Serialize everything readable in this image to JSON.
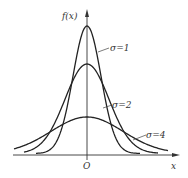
{
  "chart_data": {
    "type": "line",
    "title": "",
    "xlabel": "x",
    "ylabel": "f(x)",
    "origin_label": "O",
    "grid": false,
    "legend": "inline labels",
    "series": [
      {
        "name": "σ=1",
        "sigma": 1,
        "relative_peak": 1.0
      },
      {
        "name": "σ=2",
        "sigma": 2,
        "relative_peak": 0.71
      },
      {
        "name": "σ=4",
        "sigma": 4,
        "relative_peak": 0.29
      }
    ],
    "axis_ticks": {
      "x": [],
      "y": []
    }
  },
  "labels": {
    "y_axis": "f(x)",
    "x_axis": "x",
    "origin": "O",
    "sigma1": "σ=1",
    "sigma2": "σ=2",
    "sigma4": "σ=4"
  }
}
